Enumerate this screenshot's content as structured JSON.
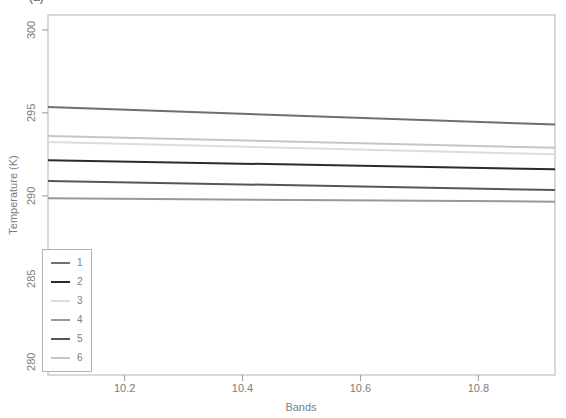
{
  "figure": {
    "corner_label": "(a)",
    "background": "#ffffff",
    "frame_color": "#b3b3b3",
    "tick_color": "#9b9b9b",
    "text_color": "#7d7d7d"
  },
  "chart_data": {
    "type": "line",
    "title": "",
    "xlabel": "Bands",
    "ylabel": "Temperature (K)",
    "xlim": [
      10.07,
      10.93
    ],
    "ylim": [
      279.2,
      300.9
    ],
    "x_ticks": [
      "10.2",
      "10.4",
      "10.6",
      "10.8"
    ],
    "x_tick_values": [
      10.2,
      10.4,
      10.6,
      10.8
    ],
    "y_ticks": [
      "280",
      "285",
      "290",
      "295",
      "300"
    ],
    "y_tick_values": [
      280,
      285,
      290,
      295,
      300
    ],
    "grid": false,
    "legend_position": "bottom-left",
    "x": [
      10.07,
      10.93
    ],
    "series": [
      {
        "name": "1",
        "color": "#6f6f6f",
        "values": [
          295.35,
          294.3
        ]
      },
      {
        "name": "2",
        "color": "#2b2b2b",
        "values": [
          292.15,
          291.6
        ]
      },
      {
        "name": "3",
        "color": "#dcdcdc",
        "values": [
          293.25,
          292.5
        ]
      },
      {
        "name": "4",
        "color": "#989898",
        "values": [
          289.85,
          289.65
        ]
      },
      {
        "name": "5",
        "color": "#565656",
        "values": [
          290.9,
          290.35
        ]
      },
      {
        "name": "6",
        "color": "#c6c6c6",
        "values": [
          293.6,
          292.9
        ]
      }
    ]
  }
}
